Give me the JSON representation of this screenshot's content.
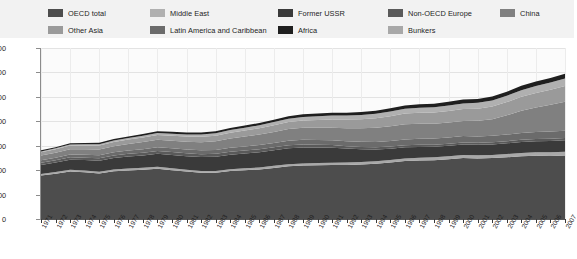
{
  "legend": {
    "rows": [
      [
        {
          "label": "OECD total",
          "color": "#4d4d4d",
          "name": "legend-item-oecd-total"
        },
        {
          "label": "Middle East",
          "color": "#b0b0b0",
          "name": "legend-item-middle-east"
        },
        {
          "label": "Former USSR",
          "color": "#3a3a3a",
          "name": "legend-item-former-ussr"
        },
        {
          "label": "Non-OECD Europe",
          "color": "#5a5a5a",
          "name": "legend-item-non-oecd-europe"
        },
        {
          "label": "China",
          "color": "#808080",
          "name": "legend-item-china"
        }
      ],
      [
        {
          "label": "Other Asia",
          "color": "#9a9a9a",
          "name": "legend-item-other-asia"
        },
        {
          "label": "Latin America and Caribbean",
          "color": "#6b6b6b",
          "name": "legend-item-latin-america-and-caribbean"
        },
        {
          "label": "Africa",
          "color": "#1f1f1f",
          "name": "legend-item-africa"
        },
        {
          "label": "Bunkers",
          "color": "#a8a8a8",
          "name": "legend-item-bunkers"
        }
      ]
    ]
  },
  "chart_data": {
    "type": "area",
    "title": "",
    "subtitle": "",
    "xlabel": "",
    "ylabel": "",
    "stacked": true,
    "grid": true,
    "legend_position": "top",
    "ylim": [
      0,
      14000
    ],
    "yticks": [
      0,
      2000,
      4000,
      6000,
      8000,
      10000,
      12000,
      14000
    ],
    "ytick_labels": [
      "0",
      "2 000",
      "4 000",
      "6 000",
      "8 000",
      "10 000",
      "12 000",
      "14 000"
    ],
    "x": [
      1971,
      1972,
      1973,
      1974,
      1975,
      1976,
      1977,
      1978,
      1979,
      1980,
      1981,
      1982,
      1983,
      1984,
      1985,
      1986,
      1987,
      1988,
      1989,
      1990,
      1991,
      1992,
      1993,
      1994,
      1995,
      1996,
      1997,
      1998,
      1999,
      2000,
      2001,
      2002,
      2003,
      2004,
      2005,
      2006,
      2007
    ],
    "xtick_labels": [
      "1971",
      "1972",
      "1973",
      "1974",
      "1975",
      "1976",
      "1977",
      "1978",
      "1979",
      "1980",
      "1981",
      "1982",
      "1983",
      "1984",
      "1985",
      "1986",
      "1987",
      "1988",
      "1989",
      "1990",
      "1991",
      "1992",
      "1993",
      "1994",
      "1995",
      "1996",
      "1997",
      "1998",
      "1999",
      "2000",
      "2001",
      "2002",
      "2003",
      "2004",
      "2005",
      "2006",
      "2007"
    ],
    "series": [
      {
        "name": "OECD total",
        "color": "#4d4d4d",
        "values": [
          3560,
          3700,
          3890,
          3820,
          3720,
          3900,
          3980,
          4030,
          4120,
          4000,
          3880,
          3790,
          3790,
          3920,
          3990,
          4060,
          4180,
          4310,
          4370,
          4400,
          4420,
          4430,
          4460,
          4530,
          4620,
          4740,
          4790,
          4820,
          4900,
          4990,
          4960,
          4990,
          5050,
          5130,
          5170,
          5160,
          5200
        ]
      },
      {
        "name": "Bunkers",
        "color": "#a8a8a8",
        "values": [
          130,
          138,
          146,
          142,
          140,
          148,
          152,
          158,
          165,
          158,
          150,
          146,
          146,
          152,
          156,
          162,
          170,
          178,
          184,
          188,
          190,
          194,
          198,
          204,
          212,
          220,
          228,
          234,
          242,
          252,
          252,
          258,
          266,
          280,
          292,
          300,
          310
        ]
      },
      {
        "name": "Former USSR",
        "color": "#3a3a3a",
        "values": [
          740,
          780,
          820,
          860,
          900,
          940,
          980,
          1020,
          1060,
          1090,
          1110,
          1130,
          1160,
          1190,
          1210,
          1240,
          1270,
          1300,
          1300,
          1270,
          1230,
          1140,
          1050,
          960,
          920,
          910,
          880,
          860,
          850,
          860,
          860,
          860,
          880,
          890,
          900,
          920,
          930
        ]
      },
      {
        "name": "Non-OECD Europe",
        "color": "#5a5a5a",
        "values": [
          180,
          188,
          196,
          202,
          208,
          214,
          220,
          226,
          232,
          236,
          238,
          240,
          242,
          246,
          250,
          252,
          254,
          256,
          250,
          230,
          212,
          196,
          188,
          180,
          178,
          178,
          176,
          172,
          170,
          170,
          172,
          174,
          176,
          180,
          182,
          184,
          186
        ]
      },
      {
        "name": "Latin America and Caribbean",
        "color": "#6b6b6b",
        "values": [
          200,
          212,
          228,
          240,
          248,
          262,
          272,
          286,
          300,
          308,
          312,
          316,
          318,
          328,
          336,
          346,
          356,
          368,
          378,
          386,
          396,
          410,
          422,
          436,
          452,
          470,
          488,
          500,
          508,
          522,
          520,
          528,
          538,
          558,
          576,
          592,
          608
        ]
      },
      {
        "name": "China",
        "color": "#808080",
        "values": [
          390,
          410,
          440,
          450,
          480,
          500,
          540,
          580,
          610,
          620,
          640,
          670,
          710,
          760,
          810,
          850,
          900,
          950,
          980,
          1000,
          1030,
          1060,
          1110,
          1160,
          1210,
          1240,
          1230,
          1220,
          1230,
          1230,
          1270,
          1360,
          1580,
          1830,
          2010,
          2190,
          2370
        ]
      },
      {
        "name": "Other Asia",
        "color": "#9a9a9a",
        "values": [
          260,
          278,
          298,
          308,
          320,
          340,
          358,
          380,
          400,
          410,
          420,
          432,
          448,
          472,
          492,
          516,
          544,
          578,
          608,
          638,
          672,
          708,
          746,
          786,
          830,
          872,
          906,
          916,
          948,
          980,
          1000,
          1038,
          1082,
          1140,
          1186,
          1232,
          1282
        ]
      },
      {
        "name": "Middle East",
        "color": "#b0b0b0",
        "values": [
          70,
          78,
          88,
          96,
          106,
          118,
          130,
          142,
          156,
          166,
          176,
          188,
          202,
          216,
          230,
          244,
          258,
          272,
          286,
          300,
          314,
          330,
          346,
          362,
          380,
          396,
          414,
          430,
          444,
          460,
          474,
          492,
          512,
          540,
          566,
          592,
          618
        ]
      },
      {
        "name": "Africa",
        "color": "#1f1f1f",
        "values": [
          90,
          96,
          104,
          108,
          114,
          120,
          128,
          136,
          144,
          150,
          156,
          162,
          168,
          176,
          184,
          192,
          200,
          208,
          216,
          222,
          230,
          238,
          246,
          254,
          264,
          274,
          284,
          292,
          300,
          310,
          318,
          328,
          340,
          356,
          370,
          384,
          398
        ]
      }
    ]
  }
}
